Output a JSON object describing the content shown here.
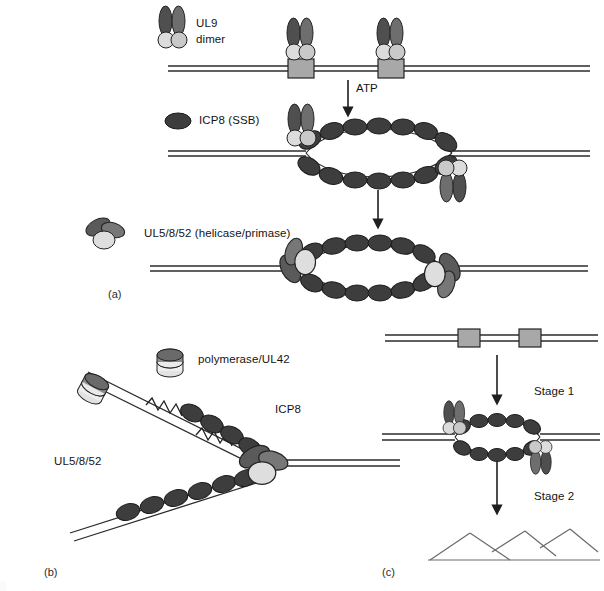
{
  "figure": {
    "panels": [
      {
        "id": "a",
        "label": "(a)",
        "x": 108,
        "y": 288
      },
      {
        "id": "b",
        "label": "(b)",
        "x": 44,
        "y": 566
      },
      {
        "id": "c",
        "label": "(c)",
        "x": 382,
        "y": 566
      }
    ]
  },
  "labels": {
    "ul9_line1": "UL9",
    "ul9_line2": "dimer",
    "icp8_ssb": "ICP8 (SSB)",
    "helicase_primase": "UL5/8/52 (helicase/primase)",
    "atp": "ATP",
    "polymerase_ul42": "polymerase/UL42",
    "icp8": "ICP8",
    "ul5_8_52": "UL5/8/52",
    "stage1": "Stage 1",
    "stage2": "Stage 2"
  },
  "colors": {
    "dark_protein": "#4a4a4a",
    "mid_protein": "#7d7d7d",
    "light_protein": "#d4d4d4",
    "icp8_bead": "#3d3d3d",
    "origin_box": "#a8a8a8",
    "dna_line": "#2b2b2b",
    "arrow": "#1f1f1f",
    "text": "#141414",
    "background": "#ffffff"
  },
  "legend_keys": [
    {
      "name": "UL9 dimer",
      "glyph": "two-dark-ellipses-over-two-light-circles"
    },
    {
      "name": "ICP8 (SSB)",
      "glyph": "single-dark-ellipse"
    },
    {
      "name": "UL5/8/52 (helicase/primase)",
      "glyph": "three-ellipse-cluster"
    },
    {
      "name": "polymerase/UL42",
      "glyph": "stacked-disc-cylinder"
    }
  ],
  "panel_a": {
    "steps": [
      {
        "step": 1,
        "description": "Two UL9 dimers bound at origin boxes on duplex DNA",
        "ul9_count": 2,
        "origin_boxes": 2
      },
      {
        "step": 2,
        "description": "ATP-dependent origin unwinding; ICP8 coats the single-stranded bubble",
        "icp8_beads_top": 8,
        "icp8_beads_bottom": 8,
        "ul9_count": 2
      },
      {
        "step": 3,
        "description": "UL5/8/52 helicase/primase loaded at both forks of the bubble",
        "icp8_beads_top": 7,
        "icp8_beads_bottom": 7,
        "helicase_count": 2
      }
    ],
    "arrows": [
      {
        "from_step": 1,
        "to_step": 2,
        "label": "ATP"
      },
      {
        "from_step": 2,
        "to_step": 3,
        "label": ""
      }
    ]
  },
  "panel_b": {
    "description": "Replication fork: leading and lagging strands with polymerase/UL42, ICP8-coated ssDNA and RNA primers",
    "icp8_beads_leading": 4,
    "icp8_beads_lagging": 6,
    "primers": 2,
    "polymerases": 2
  },
  "panel_c": {
    "stages": [
      {
        "stage": 1,
        "label": "Stage 1",
        "description": "Origin-dependent theta-form replication bubble with UL9 and ICP8"
      },
      {
        "stage": 2,
        "label": "Stage 2",
        "description": "Rolling-circle / recombination-dependent branched concatemers"
      }
    ],
    "origin_boxes": 2,
    "branches": 4
  }
}
